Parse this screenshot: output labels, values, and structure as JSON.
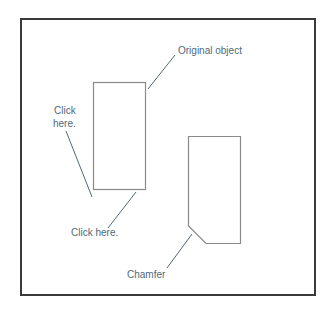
{
  "diagram": {
    "labels": {
      "original_object": "Original object",
      "click_here_left_line1": "Click",
      "click_here_left_line2": "here.",
      "click_here_bottom": "Click here.",
      "chamfer": "Chamfer"
    },
    "colors": {
      "frame": "#3a3a3a",
      "shape_stroke": "#8a8a8a",
      "leader": "#4f6a78",
      "text": "#4f6a78"
    }
  }
}
